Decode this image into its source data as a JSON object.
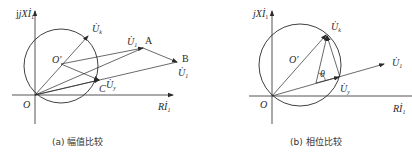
{
  "diagrams": [
    {
      "id": "a",
      "caption": "(a) 幅值比较",
      "y_axis_label": "jXİ",
      "y_axis_sub": "1",
      "x_axis_label": "Rİ",
      "x_axis_sub": "1",
      "origin_label": "O",
      "center_label": "O'",
      "vectors": {
        "uk": "U̇",
        "uk_sub": "k",
        "u1_a": "U̇",
        "u1_a_sub": "1",
        "u1_b": "U̇",
        "u1_b_sub": "1",
        "uy": "U̇",
        "uy_sub": "y"
      },
      "points": {
        "A": "A",
        "B": "B",
        "C": "C"
      }
    },
    {
      "id": "b",
      "caption": "(b) 相位比较",
      "y_axis_label": "jXİ",
      "y_axis_sub": "1",
      "x_axis_label": "Rİ",
      "x_axis_sub": "1",
      "origin_label": "O",
      "center_label": "O'",
      "angle_label": "θ",
      "vectors": {
        "uk": "U̇",
        "uk_sub": "k",
        "u1": "U̇",
        "u1_sub": "1",
        "uy": "U̇",
        "uy_sub": "y"
      }
    }
  ],
  "colors": {
    "line": "#2a2a2a",
    "background": "#ffffff"
  }
}
